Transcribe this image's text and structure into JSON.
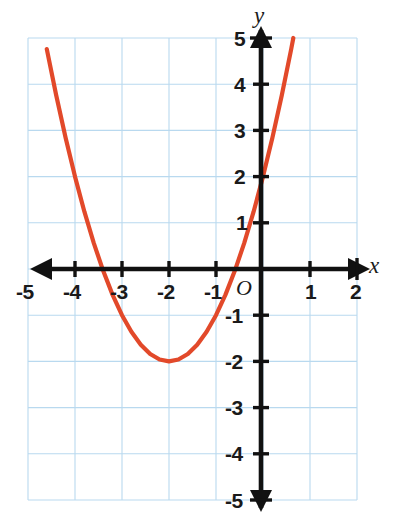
{
  "figure": {
    "kind": "coordinate-plane-graph",
    "width": 394,
    "height": 531,
    "background_color": "#ffffff"
  },
  "axes": {
    "x_axis_label": "x",
    "y_axis_label": "y",
    "origin_label": "O",
    "axis_color": "#111111",
    "grid_color": "#b9d9ef",
    "x_tick_labels": [
      "-5",
      "-4",
      "-3",
      "-2",
      "-1",
      "1",
      "2"
    ],
    "y_tick_labels": [
      "5",
      "4",
      "3",
      "2",
      "1",
      "-1",
      "-2",
      "-3",
      "-4",
      "-5"
    ]
  },
  "chart_data": {
    "type": "line",
    "title": "",
    "xlabel": "x",
    "ylabel": "y",
    "xlim": [
      -5,
      2
    ],
    "ylim": [
      -5,
      5
    ],
    "grid": true,
    "legend": "none",
    "x_ticks": [
      -5,
      -4,
      -3,
      -2,
      -1,
      1,
      2
    ],
    "y_ticks": [
      5,
      4,
      3,
      2,
      1,
      -1,
      -2,
      -3,
      -4,
      -5
    ],
    "series": [
      {
        "name": "parabola",
        "equation": "y = (x + 2)^2 - 2",
        "color": "#e2492a",
        "vertex": [
          -2,
          -2
        ],
        "y_intercept": 2,
        "x_intercepts": [
          -3.41,
          -0.59
        ],
        "x": [
          -5.0,
          -4.8,
          -4.6,
          -4.4,
          -4.2,
          -4.0,
          -3.8,
          -3.6,
          -3.4,
          -3.2,
          -3.0,
          -2.8,
          -2.6,
          -2.4,
          -2.2,
          -2.0,
          -1.8,
          -1.6,
          -1.4,
          -1.2,
          -1.0,
          -0.8,
          -0.6,
          -0.4,
          -0.2,
          0.0,
          0.2,
          0.4,
          0.6,
          0.645
        ],
        "y": [
          7.0,
          5.84,
          4.76,
          3.76,
          2.84,
          2.0,
          1.24,
          0.56,
          -0.04,
          -0.56,
          -1.0,
          -1.36,
          -1.64,
          -1.84,
          -1.96,
          -2.0,
          -1.96,
          -1.84,
          -1.64,
          -1.36,
          -1.0,
          -0.56,
          -0.04,
          0.56,
          1.24,
          2.0,
          2.84,
          3.76,
          4.76,
          5.0
        ]
      }
    ]
  },
  "annotations": {
    "arrowheads": [
      "x-axis-left",
      "x-axis-right",
      "y-axis-up",
      "y-axis-down"
    ]
  }
}
